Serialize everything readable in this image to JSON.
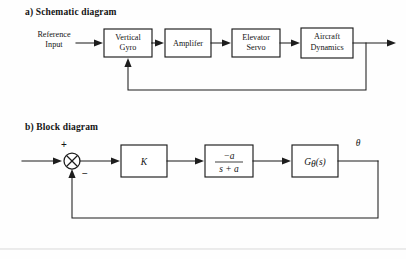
{
  "figure": {
    "background_color": "#fefefe",
    "line_color": "#1d1d1a",
    "box_fill": "#ffffff"
  },
  "schematic": {
    "title": "a) Schematic diagram",
    "input_label_line1": "Reference",
    "input_label_line2": "Input",
    "blocks": [
      {
        "line1": "Vertical",
        "line2": "Gyro"
      },
      {
        "line1": "Amplifer",
        "line2": ""
      },
      {
        "line1": "Elevator",
        "line2": "Servo"
      },
      {
        "line1": "Aircraft",
        "line2": "Dynamics"
      }
    ]
  },
  "block_diagram": {
    "title": "b) Block diagram",
    "sum_plus": "+",
    "sum_minus": "−",
    "gain_label": "K",
    "tf_numerator": "−a",
    "tf_denominator": "s + a",
    "plant_main": "G",
    "plant_subscript": "θ",
    "plant_arg": "(s)",
    "output_label": "θ"
  }
}
